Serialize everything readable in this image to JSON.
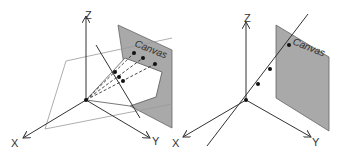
{
  "diagrams": [
    {
      "id": "left",
      "axes": {
        "x_label": "X",
        "y_label": "Y",
        "z_label": "Z"
      },
      "canvas_label": "Canvas",
      "description": "Projection of points on a line onto a canvas plane via dashed rays from origin"
    },
    {
      "id": "right",
      "axes": {
        "x_label": "X",
        "y_label": "Y",
        "z_label": "Z"
      },
      "canvas_label": "Canvas",
      "description": "Line through origin with points projecting to a single point on canvas"
    }
  ],
  "colors": {
    "canvas_fill": "#a9a9a9",
    "line": "#333333",
    "light_line": "#999999"
  }
}
